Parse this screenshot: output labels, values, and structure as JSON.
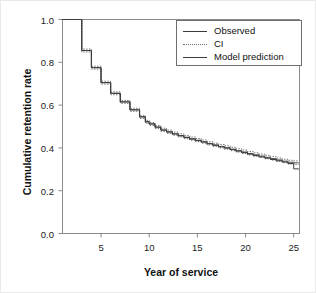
{
  "chart_data": {
    "type": "line",
    "subtype": "step-survival-curve",
    "title": "",
    "xlabel": "Year of service",
    "ylabel": "Cumulative retention rate",
    "xlim": [
      1,
      25.6
    ],
    "ylim": [
      0.0,
      1.0
    ],
    "xticks": [
      5,
      10,
      15,
      20,
      25
    ],
    "xtick_labels": [
      "5",
      "10",
      "15",
      "20",
      "25"
    ],
    "yticks": [
      0.0,
      0.2,
      0.4,
      0.6,
      0.8,
      1.0
    ],
    "ytick_labels": [
      "0.0",
      "0.2",
      "0.4",
      "0.6",
      "0.8",
      "1.0"
    ],
    "grid": false,
    "legend_position": "upper right",
    "legend_entries": [
      {
        "label": "Observed",
        "style": "solid",
        "color": "#3a3a3a"
      },
      {
        "label": "CI",
        "style": "dotted",
        "color": "#6a6a6a"
      },
      {
        "label": "Model prediction",
        "style": "solid",
        "color": "#3a3a3a"
      }
    ],
    "x": [
      1.0,
      2.0,
      3.0,
      4.0,
      5.0,
      6.0,
      7.0,
      8.0,
      9.0,
      9.6,
      10.0,
      10.6,
      11.2,
      11.8,
      12.4,
      13.0,
      13.6,
      14.2,
      14.8,
      15.4,
      16.0,
      16.6,
      17.2,
      17.8,
      18.4,
      19.0,
      19.6,
      20.2,
      20.8,
      21.4,
      22.0,
      22.6,
      23.2,
      23.8,
      24.4,
      25.0,
      25.5
    ],
    "series": [
      {
        "name": "Observed",
        "style": "solid",
        "values": [
          1.0,
          1.0,
          0.855,
          0.775,
          0.705,
          0.655,
          0.615,
          0.578,
          0.545,
          0.522,
          0.512,
          0.497,
          0.483,
          0.474,
          0.465,
          0.456,
          0.448,
          0.441,
          0.434,
          0.427,
          0.419,
          0.412,
          0.405,
          0.399,
          0.392,
          0.385,
          0.378,
          0.371,
          0.364,
          0.358,
          0.352,
          0.346,
          0.34,
          0.334,
          0.327,
          0.302,
          0.3
        ]
      },
      {
        "name": "Model prediction",
        "style": "solid",
        "values": [
          1.0,
          1.0,
          0.855,
          0.775,
          0.705,
          0.655,
          0.615,
          0.578,
          0.545,
          0.522,
          0.512,
          0.497,
          0.484,
          0.475,
          0.466,
          0.458,
          0.45,
          0.443,
          0.436,
          0.429,
          0.421,
          0.414,
          0.407,
          0.401,
          0.394,
          0.387,
          0.381,
          0.374,
          0.368,
          0.362,
          0.356,
          0.35,
          0.344,
          0.338,
          0.333,
          0.33,
          0.329
        ]
      },
      {
        "name": "CI upper",
        "style": "dotted",
        "values": [
          1.0,
          1.0,
          0.862,
          0.782,
          0.712,
          0.662,
          0.622,
          0.585,
          0.552,
          0.529,
          0.519,
          0.505,
          0.492,
          0.483,
          0.474,
          0.466,
          0.458,
          0.451,
          0.444,
          0.437,
          0.429,
          0.422,
          0.416,
          0.41,
          0.403,
          0.396,
          0.39,
          0.383,
          0.377,
          0.371,
          0.365,
          0.359,
          0.353,
          0.347,
          0.342,
          0.339,
          0.338
        ]
      },
      {
        "name": "CI lower",
        "style": "dotted",
        "values": [
          1.0,
          1.0,
          0.848,
          0.768,
          0.698,
          0.648,
          0.608,
          0.571,
          0.538,
          0.515,
          0.505,
          0.49,
          0.477,
          0.468,
          0.459,
          0.451,
          0.443,
          0.436,
          0.429,
          0.422,
          0.414,
          0.407,
          0.4,
          0.394,
          0.387,
          0.38,
          0.374,
          0.367,
          0.361,
          0.355,
          0.349,
          0.343,
          0.337,
          0.331,
          0.325,
          0.322,
          0.321
        ]
      }
    ]
  },
  "axes": {
    "x_title": "Year of service",
    "y_title": "Cumulative retention rate"
  },
  "legend": {
    "items": [
      {
        "label": "Observed"
      },
      {
        "label": "CI"
      },
      {
        "label": "Model prediction"
      }
    ]
  }
}
